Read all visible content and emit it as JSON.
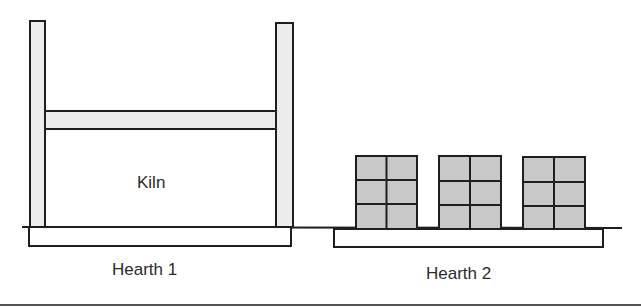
{
  "diagram": {
    "kiln_label": "Kiln",
    "hearth1_label": "Hearth 1",
    "hearth2_label": "Hearth 2",
    "stack_count": 3,
    "stack_grid": {
      "cols": 2,
      "rows": 3
    },
    "colors": {
      "stroke": "#1e1e1e",
      "post_fill": "#ececec",
      "stack_fill": "#c8c8c8",
      "slab_fill": "#ffffff"
    }
  }
}
